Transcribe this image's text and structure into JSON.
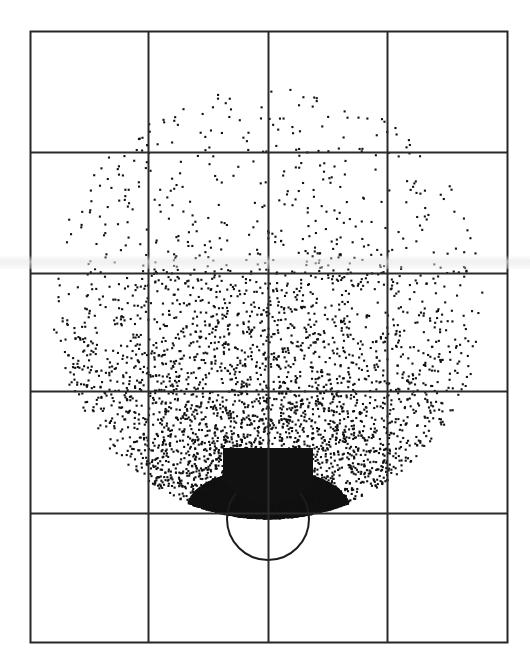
{
  "figure": {
    "width": 530,
    "height": 669,
    "background_color": "#ffffff",
    "title": "",
    "caption": ""
  },
  "axes": {
    "plot_left": 30,
    "plot_top": 31,
    "plot_right": 507,
    "plot_bottom": 642,
    "frame_color": "#262626",
    "frame_width": 2,
    "grid_color": "#2b2b2b",
    "grid_width": 2,
    "grid_on": true,
    "x_gridlines": [
      148,
      268,
      387
    ],
    "y_gridlines": [
      152,
      273,
      391,
      513
    ],
    "n_columns": 4,
    "n_rows": 5,
    "x_tick_labels": [],
    "y_tick_labels": [],
    "xlabel": "",
    "ylabel": ""
  },
  "chart_data": {
    "type": "scatter",
    "title": "",
    "subtitle": "",
    "xlabel": "",
    "ylabel": "",
    "xlim": [
      30,
      507
    ],
    "ylim": [
      642,
      31
    ],
    "grid": true,
    "legend": [],
    "point_color": "#111111",
    "point_size": 2.1,
    "n_points": 18000,
    "distribution": "radial-disk-with-apex-concentration",
    "cloud": {
      "center_x": 268,
      "center_y": 302,
      "radius": 216,
      "apex_x": 268,
      "apex_y": 524,
      "density_exponent": 2.35,
      "angular_bias": 0.34,
      "saturation_radius": 56,
      "top_edge_y": 76,
      "left_edge_x": 54,
      "right_edge_x": 484,
      "bottom_edge_y": 530
    },
    "overlay_circle": {
      "name": "reference-circle",
      "center_x": 268,
      "center_y": 519,
      "radius": 41,
      "stroke_color": "#1c1c1c",
      "stroke_width": 2,
      "filled": false
    },
    "scan_band": {
      "y": 255,
      "height": 14,
      "color": "#ebebeb"
    },
    "notes": "Dense black saturated core at the lower-centre apex, density decaying radially outward to sparse isolated dots near the disk rim; no axis tick labels are printed."
  }
}
